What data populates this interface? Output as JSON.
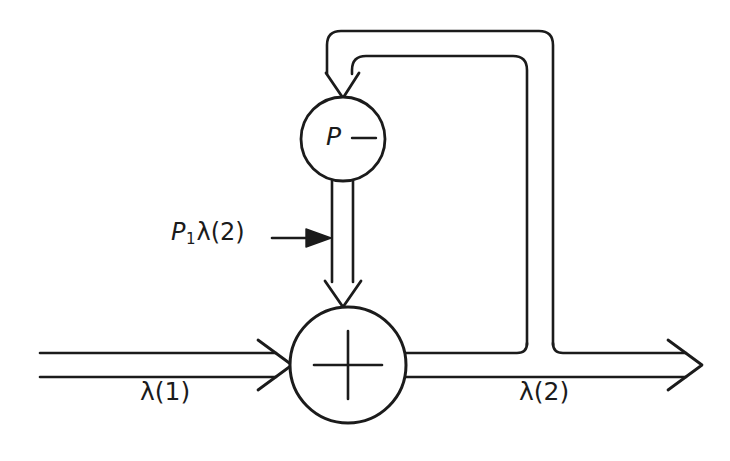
{
  "figure": {
    "type": "block-diagram",
    "title": "",
    "background_color": "#ffffff",
    "line_color": "#1b1b1b"
  },
  "blocks": [
    {
      "id": "p-block",
      "shape": "circle",
      "label": "P",
      "center": [
        343,
        139
      ],
      "radius": 42
    },
    {
      "id": "sum-junction",
      "shape": "circle",
      "label": "+",
      "center": [
        348,
        365
      ],
      "radius": 58
    }
  ],
  "labels": {
    "input_flow": "λ(1)",
    "output_flow": "λ(2)",
    "feedback_flow_prefix": "P",
    "feedback_flow_subscript": "1",
    "feedback_flow_suffix": "λ(2)",
    "p_block_symbol": "P"
  },
  "connections": [
    {
      "id": "input-line",
      "from": "left-edge",
      "to": "sum-junction",
      "style": "double-line",
      "arrowhead": "open",
      "label": "λ(1)"
    },
    {
      "id": "output-line",
      "from": "sum-junction",
      "to": "right-edge",
      "style": "double-line",
      "arrowhead": "open",
      "label": "λ(2)"
    },
    {
      "id": "feedback-line",
      "from": "output-line",
      "to": "p-block",
      "style": "double-line",
      "arrowhead": "open",
      "label": ""
    },
    {
      "id": "p-to-sum-line",
      "from": "p-block",
      "to": "sum-junction",
      "style": "double-line",
      "arrowhead": "open",
      "label": "P₁λ(2)"
    }
  ]
}
